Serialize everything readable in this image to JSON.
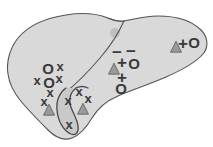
{
  "figure": {
    "organ_label": "liver",
    "canvas": {
      "width": 213,
      "height": 147
    },
    "style": {
      "organ_fill": "#d9d9d9",
      "organ_stroke": "#555555",
      "fissure_stroke": "#555555",
      "vessel_fill": "#c9c9c9",
      "vessel_stroke": "#4a4a4a",
      "triangle_fill": "#9a9a9a",
      "triangle_stroke": "#5a5a5a",
      "dot_fill": "#c0c0c0",
      "marker_color": "#3a3a3a",
      "background": "#ffffff"
    },
    "shapes": {
      "organ_outline": "M 8,74 C 6,62 10,48 18,38 C 28,26 46,18 66,15 C 84,12 98,14 108,18 C 114,20 118,22 124,21 C 134,19 146,16 158,16 C 176,16 192,21 201,30 C 208,37 209,47 203,54 C 196,62 182,70 166,77 C 150,84 132,90 118,96 C 106,101 98,108 92,118 C 86,128 80,135 72,138 C 64,141 56,138 48,130 C 38,120 28,110 20,100 C 12,90 9,82 8,74 Z",
      "fissure_line": "M 124,21 C 120,30 112,44 100,58 C 88,72 76,84 66,92",
      "lobe_notch": "M 108,18 C 112,20 118,22 124,21",
      "gallbladder": "M 66,88 C 60,92 56,100 57,110 C 58,122 64,131 71,134 C 76,136 79,132 78,126 C 77,118 72,112 70,104 C 69,98 71,92 76,88",
      "gallbladder_neck": "M 76,88 C 80,86 84,86 88,88"
    },
    "markers": {
      "left_lobe": [
        {
          "symbol": "O",
          "type": "circle-marker",
          "x": 48,
          "y": 68
        },
        {
          "symbol": "x",
          "type": "cross-marker",
          "x": 60,
          "y": 66
        },
        {
          "symbol": "x",
          "type": "cross-marker",
          "x": 37,
          "y": 80
        },
        {
          "symbol": "O",
          "type": "circle-marker",
          "x": 49,
          "y": 82
        },
        {
          "symbol": "x",
          "type": "cross-marker",
          "x": 59,
          "y": 78
        },
        {
          "symbol": "x",
          "type": "cross-marker",
          "x": 50,
          "y": 92
        },
        {
          "symbol": "x",
          "type": "cross-marker",
          "x": 44,
          "y": 101
        },
        {
          "symbol": "x",
          "type": "cross-marker",
          "x": 79,
          "y": 91
        },
        {
          "symbol": "x",
          "type": "cross-marker",
          "x": 68,
          "y": 100
        },
        {
          "symbol": "x",
          "type": "cross-marker",
          "x": 88,
          "y": 98
        },
        {
          "symbol": "x",
          "type": "cross-marker",
          "x": 69,
          "y": 124
        }
      ],
      "center": [
        {
          "symbol": "−",
          "type": "minus-marker",
          "x": 117,
          "y": 52
        },
        {
          "symbol": "−",
          "type": "minus-marker",
          "x": 131,
          "y": 51
        },
        {
          "symbol": "+",
          "type": "plus-marker",
          "x": 122,
          "y": 62
        },
        {
          "symbol": "O",
          "type": "circle-marker",
          "x": 134,
          "y": 63
        },
        {
          "symbol": "+",
          "type": "plus-marker",
          "x": 122,
          "y": 77
        },
        {
          "symbol": "O",
          "type": "circle-marker",
          "x": 121,
          "y": 88
        }
      ],
      "right_lobe": [
        {
          "symbol": "+",
          "type": "plus-marker",
          "x": 183,
          "y": 43
        },
        {
          "symbol": "O",
          "type": "circle-marker",
          "x": 194,
          "y": 42
        }
      ],
      "triangles": [
        {
          "type": "triangle-marker",
          "x": 49,
          "y": 111,
          "size": 11
        },
        {
          "type": "triangle-marker",
          "x": 83,
          "y": 110,
          "size": 11
        },
        {
          "type": "triangle-marker",
          "x": 114,
          "y": 70,
          "size": 11
        },
        {
          "type": "triangle-marker",
          "x": 176,
          "y": 48,
          "size": 11
        }
      ],
      "dot": {
        "type": "gray-dot",
        "x": 115,
        "y": 33,
        "radius": 5
      }
    }
  }
}
